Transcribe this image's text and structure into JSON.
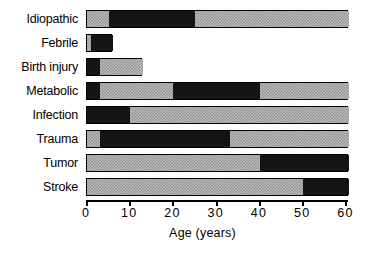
{
  "chart_data": {
    "type": "bar",
    "orientation": "horizontal",
    "stacked": true,
    "title": "",
    "subtitle": "",
    "xlabel": "Age (years)",
    "ylabel": "",
    "xlim": [
      0,
      60.6
    ],
    "xticks": [
      0,
      10,
      20,
      30,
      40,
      50,
      60
    ],
    "xticklabels": [
      "0",
      "10",
      "20",
      "30",
      "40",
      "50",
      "60"
    ],
    "grid": false,
    "legend": null,
    "categories": [
      "Idiopathic",
      "Febrile",
      "Birth injury",
      "Metabolic",
      "Infection",
      "Trauma",
      "Tumor",
      "Stroke"
    ],
    "bars": [
      {
        "category": "Idiopathic",
        "start": 0,
        "end": 60.6,
        "segments": [
          {
            "from": 0,
            "to": 5,
            "fill": "gray"
          },
          {
            "from": 5,
            "to": 25,
            "fill": "black"
          },
          {
            "from": 25,
            "to": 60.6,
            "fill": "gray"
          }
        ]
      },
      {
        "category": "Febrile",
        "start": 0,
        "end": 6,
        "segments": [
          {
            "from": 0,
            "to": 1,
            "fill": "gray"
          },
          {
            "from": 1,
            "to": 6,
            "fill": "black"
          }
        ]
      },
      {
        "category": "Birth injury",
        "start": 0,
        "end": 13,
        "segments": [
          {
            "from": 0,
            "to": 3,
            "fill": "black"
          },
          {
            "from": 3,
            "to": 13,
            "fill": "gray"
          }
        ]
      },
      {
        "category": "Metabolic",
        "start": 0,
        "end": 60.6,
        "segments": [
          {
            "from": 0,
            "to": 3,
            "fill": "black"
          },
          {
            "from": 3,
            "to": 20,
            "fill": "gray"
          },
          {
            "from": 20,
            "to": 40,
            "fill": "black"
          },
          {
            "from": 40,
            "to": 60.6,
            "fill": "gray"
          }
        ]
      },
      {
        "category": "Infection",
        "start": 0,
        "end": 60.6,
        "segments": [
          {
            "from": 0,
            "to": 10,
            "fill": "black"
          },
          {
            "from": 10,
            "to": 60.6,
            "fill": "gray"
          }
        ]
      },
      {
        "category": "Trauma",
        "start": 0,
        "end": 60.6,
        "segments": [
          {
            "from": 0,
            "to": 3,
            "fill": "gray"
          },
          {
            "from": 3,
            "to": 33,
            "fill": "black"
          },
          {
            "from": 33,
            "to": 60.6,
            "fill": "gray"
          }
        ]
      },
      {
        "category": "Tumor",
        "start": 0,
        "end": 60.6,
        "segments": [
          {
            "from": 0,
            "to": 40,
            "fill": "gray"
          },
          {
            "from": 40,
            "to": 60.6,
            "fill": "black"
          }
        ]
      },
      {
        "category": "Stroke",
        "start": 0,
        "end": 60.6,
        "segments": [
          {
            "from": 0,
            "to": 50,
            "fill": "gray"
          },
          {
            "from": 50,
            "to": 60.6,
            "fill": "black"
          }
        ]
      }
    ],
    "colors": {
      "black_segment": "#141414",
      "gray_segment": "#b9b9b9",
      "axis": "#000000",
      "background": "#ffffff"
    }
  }
}
